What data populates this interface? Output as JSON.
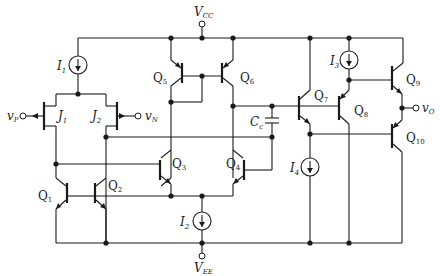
{
  "diagram": {
    "supplies": {
      "vcc": {
        "label": "V",
        "sub": "CC"
      },
      "vee": {
        "label": "V",
        "sub": "EE"
      }
    },
    "inputs": {
      "vp": {
        "label": "v",
        "sub": "P"
      },
      "vn": {
        "label": "v",
        "sub": "N"
      }
    },
    "output": {
      "label": "v",
      "sub": "O"
    },
    "jfets": [
      {
        "label": "J",
        "sub": "1"
      },
      {
        "label": "J",
        "sub": "2"
      }
    ],
    "current_sources": [
      {
        "label": "I",
        "sub": "1"
      },
      {
        "label": "I",
        "sub": "2"
      },
      {
        "label": "I",
        "sub": "3"
      },
      {
        "label": "I",
        "sub": "4"
      }
    ],
    "transistors": [
      {
        "label": "Q",
        "sub": "1"
      },
      {
        "label": "Q",
        "sub": "2"
      },
      {
        "label": "Q",
        "sub": "3"
      },
      {
        "label": "Q",
        "sub": "4"
      },
      {
        "label": "Q",
        "sub": "5"
      },
      {
        "label": "Q",
        "sub": "6"
      },
      {
        "label": "Q",
        "sub": "7"
      },
      {
        "label": "Q",
        "sub": "8"
      },
      {
        "label": "Q",
        "sub": "9"
      },
      {
        "label": "Q",
        "sub": "10"
      }
    ],
    "capacitor": {
      "label": "C",
      "sub": "c"
    }
  }
}
